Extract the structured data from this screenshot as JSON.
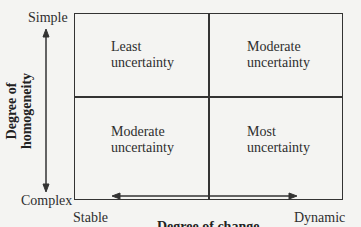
{
  "y_axis": {
    "title_line1": "Degree of",
    "title_line2": "homogeneity",
    "top_label": "Simple",
    "bottom_label": "Complex"
  },
  "x_axis": {
    "title": "Degree of change",
    "left_label": "Stable",
    "right_label": "Dynamic"
  },
  "quadrants": [
    {
      "line1": "Least",
      "line2": "uncertainty"
    },
    {
      "line1": "Moderate",
      "line2": "uncertainty"
    },
    {
      "line1": "Moderate",
      "line2": "uncertainty"
    },
    {
      "line1": "Most",
      "line2": "uncertainty"
    }
  ]
}
